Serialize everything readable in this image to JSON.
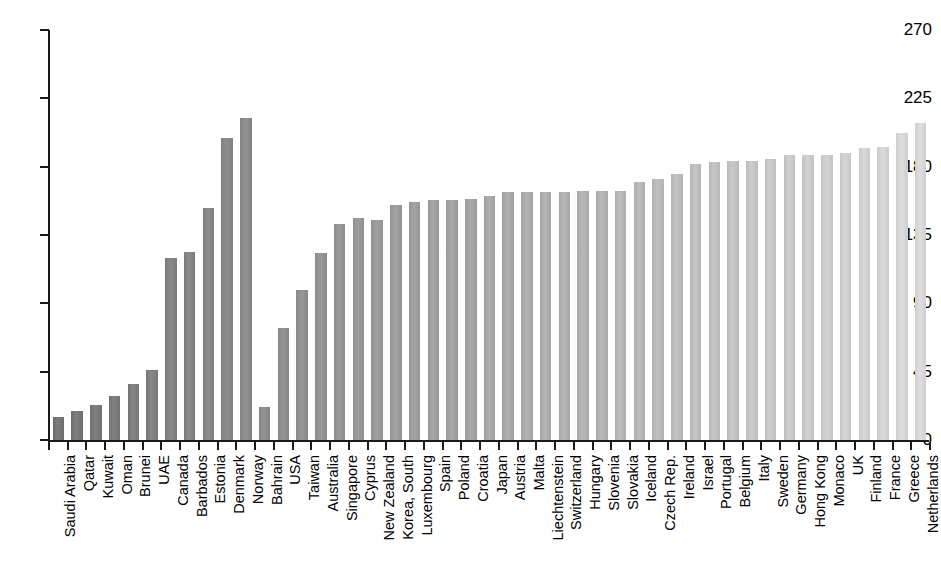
{
  "chart_data": {
    "type": "bar",
    "title": "",
    "subtitle": "",
    "xlabel": "",
    "ylabel": "",
    "ylim": [
      0,
      270
    ],
    "yticks": [
      0,
      45,
      90,
      135,
      180,
      225,
      270
    ],
    "grid": false,
    "legend": "none",
    "orientation": "vertical",
    "bar_colors_note": "Single series; bars shaded progressively from dark gray on the left to light gray on the right",
    "colors": {
      "axis": "#1a1a1a",
      "text": "#000000",
      "background": "#ffffff",
      "bar_darkest": "#6e6e6e",
      "bar_lightest": "#cfcfcf"
    },
    "categories": [
      "Saudi Arabia",
      "Qatar",
      "Kuwait",
      "Oman",
      "Brunei",
      "UAE",
      "Canada",
      "Barbados",
      "Estonia",
      "Denmark",
      "Norway",
      "Bahrain",
      "USA",
      "Taiwan",
      "Australia",
      "Singapore",
      "Cyprus",
      "New Zealand",
      "Korea, South",
      "Luxembourg",
      "Spain",
      "Poland",
      "Croatia",
      "Japan",
      "Austria",
      "Malta",
      "Liechtenstein",
      "Switzerland",
      "Hungary",
      "Slovenia",
      "Slovakia",
      "Iceland",
      "Czech Rep.",
      "Ireland",
      "Israel",
      "Portugal",
      "Belgium",
      "Italy",
      "Sweden",
      "Germany",
      "Hong Kong",
      "Monaco",
      "UK",
      "Finland",
      "France",
      "Greece",
      "Netherlands"
    ],
    "values": [
      15,
      19,
      23,
      29,
      37,
      46,
      120,
      124,
      153,
      199,
      212,
      22,
      74,
      99,
      123,
      142,
      146,
      145,
      155,
      157,
      158,
      158,
      159,
      161,
      163,
      163,
      163,
      163,
      164,
      164,
      164,
      170,
      172,
      175,
      182,
      183,
      184,
      184,
      185,
      188,
      188,
      188,
      189,
      192,
      193,
      202,
      209
    ]
  }
}
